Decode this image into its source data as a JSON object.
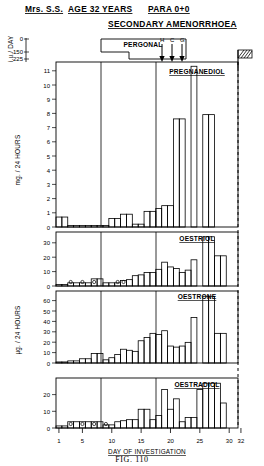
{
  "header": {
    "patient": "Mrs. S.S.",
    "age": "AGE 32 YEARS",
    "para": "PARA 0+0",
    "diagnosis": "SECONDARY AMENORRHOEA"
  },
  "caption": "FIG. 110",
  "treatment": {
    "pergonal_label": "PERGONAL",
    "hcg_label": "H C G",
    "hcg_letters": [
      "H",
      "C",
      "G"
    ],
    "dose_axis_label": "i.u./ DAY",
    "dose_ticks": [
      "0",
      "150",
      "225"
    ],
    "menses_marker": "hatched-flag"
  },
  "xaxis": {
    "label": "DAY OF INVESTIGATION",
    "ticks": [
      1,
      5,
      10,
      15,
      20,
      25,
      30,
      32
    ],
    "min": 1,
    "max": 32
  },
  "chart_data": [
    {
      "type": "bar",
      "title": "PREGNANEDIOL",
      "ylabel": "mg. / 24 HOURS",
      "ylim": [
        0,
        11.6
      ],
      "yticks": [
        0,
        1,
        2,
        3,
        4,
        5,
        6,
        7,
        8,
        9,
        10,
        11
      ],
      "xlabel": "DAY OF INVESTIGATION",
      "x": [
        1,
        2,
        3,
        4,
        5,
        6,
        7,
        8,
        9,
        10,
        11,
        12,
        13,
        14,
        15,
        16,
        17,
        18,
        19,
        20,
        21,
        22,
        23,
        24,
        25,
        26,
        27,
        28,
        29,
        30
      ],
      "values": [
        0.7,
        0.7,
        0.1,
        0.1,
        0.1,
        0.1,
        0.1,
        0.1,
        0.1,
        0.6,
        0.6,
        0.9,
        0.9,
        0.2,
        0.2,
        1.1,
        1.1,
        1.3,
        1.5,
        1.5,
        7.6,
        7.6,
        0.0,
        11.3,
        0.0,
        7.9,
        7.9,
        0.0,
        0.0,
        0.0
      ],
      "grid": false
    },
    {
      "type": "bar",
      "title": "OESTRIOL",
      "ylabel": "",
      "ylim": [
        0,
        34
      ],
      "yticks": [
        0,
        10,
        20,
        30
      ],
      "x": [
        1,
        2,
        3,
        4,
        5,
        6,
        7,
        8,
        9,
        10,
        11,
        12,
        13,
        14,
        15,
        16,
        17,
        18,
        19,
        20,
        21,
        22,
        23,
        24,
        25,
        26,
        27,
        28,
        29,
        30
      ],
      "values": [
        1.0,
        1.0,
        2.0,
        2.0,
        2.0,
        2.0,
        4.5,
        4.5,
        2.0,
        2.0,
        2.0,
        3.5,
        4.0,
        6.5,
        7.0,
        8.5,
        8.5,
        10.5,
        15.0,
        12.0,
        11.0,
        8.5,
        10.0,
        16.5,
        0.0,
        31.0,
        31.0,
        19.0,
        19.0,
        0.0
      ],
      "low_markers": [
        3,
        5,
        7,
        11,
        12
      ],
      "grid": false
    },
    {
      "type": "bar",
      "title": "OESTRONE",
      "ylabel": "µg. / 24 HOURS",
      "ylim": [
        0,
        68
      ],
      "yticks": [
        0,
        10,
        20,
        30,
        40,
        50,
        60
      ],
      "x": [
        1,
        2,
        3,
        4,
        5,
        6,
        7,
        8,
        9,
        10,
        11,
        12,
        13,
        14,
        15,
        16,
        17,
        18,
        19,
        20,
        21,
        22,
        23,
        24,
        25,
        26,
        27,
        28,
        29,
        30
      ],
      "values": [
        1.0,
        1.0,
        2.0,
        2.0,
        4.0,
        4.0,
        9.0,
        9.0,
        3.0,
        5.0,
        8.0,
        13.0,
        12.0,
        11.0,
        21.0,
        24.0,
        28.0,
        27.0,
        30.5,
        16.0,
        15.0,
        16.0,
        19.5,
        43.0,
        0.0,
        63.0,
        63.0,
        28.0,
        28.0,
        0.0
      ],
      "grid": false
    },
    {
      "type": "bar",
      "title": "OESTRADIOL",
      "ylabel": "",
      "ylim": [
        0,
        24
      ],
      "yticks": [
        0,
        10,
        20
      ],
      "x": [
        1,
        2,
        3,
        4,
        5,
        6,
        7,
        8,
        9,
        10,
        11,
        12,
        13,
        14,
        15,
        16,
        17,
        18,
        19,
        20,
        21,
        22,
        23,
        24,
        25,
        26,
        27,
        28,
        29,
        30
      ],
      "values": [
        1.0,
        1.0,
        3.0,
        3.0,
        3.0,
        3.0,
        3.0,
        3.0,
        1.5,
        1.5,
        3.0,
        3.5,
        4.0,
        4.0,
        9.0,
        9.0,
        4.0,
        6.0,
        18.5,
        9.0,
        14.0,
        3.0,
        5.0,
        5.0,
        18.5,
        21.5,
        21.5,
        21.5,
        12.0,
        0.0
      ],
      "low_markers": [
        3,
        5,
        7,
        9
      ],
      "grid": false
    }
  ]
}
